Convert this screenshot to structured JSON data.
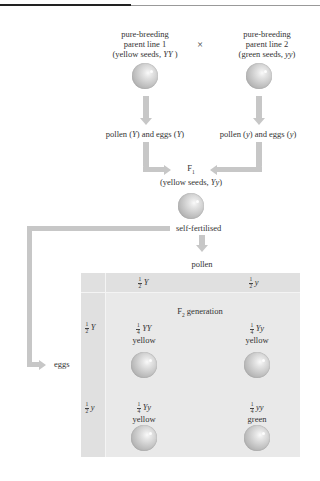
{
  "page": {
    "page_number": "000"
  },
  "parents": {
    "line1": {
      "title": "pure-breeding",
      "subtitle": "parent line 1",
      "desc_pre": "(yellow seeds, ",
      "genotype": "YY",
      "desc_post": " )"
    },
    "cross_symbol": "×",
    "line2": {
      "title": "pure-breeding",
      "subtitle": "parent line 2",
      "desc_pre": "(green seeds, ",
      "genotype": "yy",
      "desc_post": ")"
    }
  },
  "gametes": {
    "left": {
      "a": "pollen (",
      "g1": "Y",
      "b": ") and eggs (",
      "g2": "Y",
      "c": ")"
    },
    "right": {
      "a": "pollen (",
      "g1": "y",
      "b": ") and eggs (",
      "g2": "y",
      "c": ")"
    }
  },
  "f1": {
    "label": "F",
    "sub": "1",
    "desc_pre": "(yellow seeds, ",
    "genotype": "Yy",
    "desc_post": ")"
  },
  "self_fertilised": "self-fertilised",
  "pollen_label": "pollen",
  "eggs_label": "eggs",
  "punnett": {
    "title": "F",
    "title_sub": "2",
    "title_rest": " generation",
    "col_headers": [
      {
        "num": "1",
        "den": "2",
        "allele": "Y"
      },
      {
        "num": "1",
        "den": "2",
        "allele": "y"
      }
    ],
    "row_headers": [
      {
        "num": "1",
        "den": "2",
        "allele": "Y"
      },
      {
        "num": "1",
        "den": "2",
        "allele": "y"
      }
    ],
    "cells": [
      {
        "num": "1",
        "den": "4",
        "genotype": "YY",
        "phenotype": "yellow"
      },
      {
        "num": "1",
        "den": "4",
        "genotype": "Yy",
        "phenotype": "yellow"
      },
      {
        "num": "1",
        "den": "4",
        "genotype": "Yy",
        "phenotype": "yellow"
      },
      {
        "num": "1",
        "den": "4",
        "genotype": "yy",
        "phenotype": "green"
      }
    ]
  }
}
